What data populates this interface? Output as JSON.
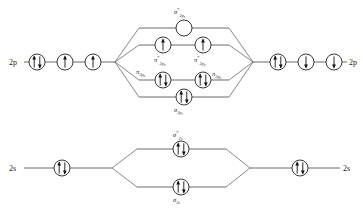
{
  "diagram": {
    "type": "molecular-orbital-energy-diagram",
    "title_visible": false,
    "colors": {
      "line": "#444444",
      "circle_stroke": "#222222",
      "circle_fill": "#ffffff",
      "arrow": "#111111",
      "text": "#1a1a1a",
      "background": "#ffffff"
    },
    "rows": [
      {
        "id": "row-2p",
        "left_axis_label": "2p",
        "right_axis_label": "2p"
      },
      {
        "id": "row-2s",
        "left_axis_label": "2s",
        "right_axis_label": "2s"
      }
    ],
    "atomic_orbitals": {
      "left_2p": [
        {
          "id": "left-2p-1",
          "electrons": "up-down"
        },
        {
          "id": "left-2p-2",
          "electrons": "up"
        },
        {
          "id": "left-2p-3",
          "electrons": "up"
        }
      ],
      "right_2p": [
        {
          "id": "right-2p-1",
          "electrons": "up-down"
        },
        {
          "id": "right-2p-2",
          "electrons": "down"
        },
        {
          "id": "right-2p-3",
          "electrons": "down"
        }
      ],
      "left_2s": [
        {
          "id": "left-2s-1",
          "electrons": "up-down"
        }
      ],
      "right_2s": [
        {
          "id": "right-2s-1",
          "electrons": "up-down"
        }
      ]
    },
    "molecular_orbitals": [
      {
        "id": "sigma-star-2pz",
        "symbol": "σ",
        "superscript": "*",
        "subscript": "2p",
        "subsubscript": "z",
        "label_position": "above",
        "electrons": "none",
        "count": 1
      },
      {
        "id": "pi-star-2px",
        "symbol": "π",
        "superscript": "*",
        "subscript": "2p",
        "subsubscript": "x",
        "label_position": "below",
        "electrons": "up",
        "count": 1
      },
      {
        "id": "pi-star-2py",
        "symbol": "π",
        "superscript": "*",
        "subscript": "2p",
        "subsubscript": "y",
        "label_position": "below",
        "electrons": "up",
        "count": 1
      },
      {
        "id": "pi-2px",
        "symbol": "π",
        "superscript": "",
        "subscript": "2p",
        "subsubscript": "x",
        "label_position": "left",
        "electrons": "up-down",
        "count": 1
      },
      {
        "id": "pi-2py",
        "symbol": "π",
        "superscript": "",
        "subscript": "2p",
        "subsubscript": "y",
        "label_position": "right",
        "electrons": "up-down",
        "count": 1
      },
      {
        "id": "sigma-2pz",
        "symbol": "σ",
        "superscript": "",
        "subscript": "2p",
        "subsubscript": "z",
        "label_position": "below",
        "electrons": "up-down",
        "count": 1
      },
      {
        "id": "sigma-star-2s",
        "symbol": "σ",
        "superscript": "*",
        "subscript": "2s",
        "subsubscript": "",
        "label_position": "above",
        "electrons": "up-down",
        "count": 1
      },
      {
        "id": "sigma-2s",
        "symbol": "σ",
        "superscript": "",
        "subscript": "2s",
        "subsubscript": "",
        "label_position": "below",
        "electrons": "up-down",
        "count": 1
      }
    ],
    "labels": {
      "left_2p": "2p",
      "right_2p": "2p",
      "left_2s": "2s",
      "right_2s": "2s",
      "sigma_star_2pz_sym": "σ",
      "sigma_star_2pz_sup": "*",
      "sigma_star_2pz_sub": "2p",
      "sigma_star_2pz_subsub": "z",
      "pi_star_2px_sym": "π",
      "pi_star_2px_sup": "*",
      "pi_star_2px_sub": "2p",
      "pi_star_2px_subsub": "x",
      "pi_star_2py_sym": "π",
      "pi_star_2py_sup": "*",
      "pi_star_2py_sub": "2p",
      "pi_star_2py_subsub": "y",
      "pi_2px_sym": "π",
      "pi_2px_sub": "2p",
      "pi_2px_subsub": "x",
      "pi_2py_sym": "π",
      "pi_2py_sub": "2p",
      "pi_2py_subsub": "y",
      "sigma_2pz_sym": "σ",
      "sigma_2pz_sub": "2p",
      "sigma_2pz_subsub": "z",
      "sigma_star_2s_sym": "σ",
      "sigma_star_2s_sup": "*",
      "sigma_star_2s_sub": "2s",
      "sigma_2s_sym": "σ",
      "sigma_2s_sub": "2s"
    }
  }
}
